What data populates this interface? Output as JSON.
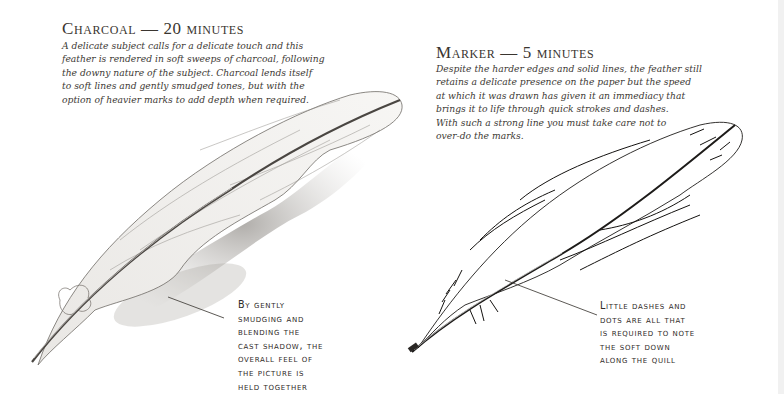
{
  "charcoal": {
    "heading": "Charcoal — 20 minutes",
    "body": "A delicate subject calls for a delicate touch and this\nfeather is rendered in soft sweeps of charcoal, following\nthe downy nature of the subject. Charcoal lends itself\nto soft lines and gently smudged tones, but with the\noption of heavier marks to add depth when required.",
    "caption": "By gently\nsmudging and\nblending the\ncast shadow, the\noverall feel of\nthe picture is\nheld together",
    "illustration": "charcoal-feather-drawing"
  },
  "marker": {
    "heading": "Marker — 5 minutes",
    "body": "Despite the harder edges and solid lines, the feather still\nretains a delicate presence on the paper but the speed\nat which it was drawn has given it an immediacy that\nbrings it to life through quick strokes and dashes.\nWith such a strong line you must take care not to\nover-do the marks.",
    "caption": "Little dashes and\ndots are all that\nis required to note\nthe soft down\nalong the quill",
    "illustration": "marker-feather-drawing"
  },
  "colors": {
    "text": "#2e2a26",
    "shadow": "#9a9691",
    "background": "#ffffff"
  }
}
